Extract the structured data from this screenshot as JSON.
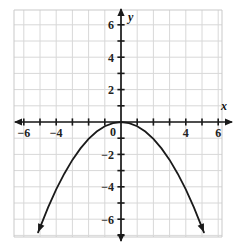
{
  "chart_data": {
    "type": "line",
    "title": "",
    "subtitle": "",
    "xlabel": "x",
    "ylabel": "y",
    "xlim": [
      -7,
      7
    ],
    "ylim": [
      -7,
      7
    ],
    "grid": true,
    "grid_step": 1,
    "legend": "none",
    "equation": "y = -0.26x^2",
    "vertex": [
      0,
      0
    ],
    "opens": "down",
    "x_ticks": [
      -7,
      -6,
      -5,
      -4,
      -3,
      -2,
      -1,
      0,
      1,
      2,
      3,
      4,
      5,
      6,
      7
    ],
    "y_ticks": [
      -7,
      -6,
      -5,
      -4,
      -3,
      -2,
      -1,
      0,
      1,
      2,
      3,
      4,
      5,
      6,
      7
    ],
    "x_tick_labels": [
      {
        "value": -6,
        "text": "−6"
      },
      {
        "value": -4,
        "text": "−4"
      },
      {
        "value": 4,
        "text": "4"
      },
      {
        "value": 6,
        "text": "6"
      }
    ],
    "y_tick_labels": [
      {
        "value": 6,
        "text": "6"
      },
      {
        "value": 4,
        "text": "4"
      },
      {
        "value": 2,
        "text": "2"
      },
      {
        "value": -2,
        "text": "−2"
      },
      {
        "value": -4,
        "text": "−4"
      },
      {
        "value": -6,
        "text": "−6"
      }
    ],
    "origin_label": "0",
    "series": [
      {
        "name": "parabola",
        "x": [
          -5.12,
          -4.5,
          -4.0,
          -3.5,
          -3.0,
          -2.5,
          -2.0,
          -1.5,
          -1.0,
          -0.5,
          0.0,
          0.5,
          1.0,
          1.5,
          2.0,
          2.5,
          3.0,
          3.5,
          4.0,
          4.5,
          5.12
        ],
        "y": [
          -6.81,
          -5.27,
          -4.16,
          -3.19,
          -2.34,
          -1.63,
          -1.04,
          -0.59,
          -0.26,
          -0.07,
          0.0,
          -0.07,
          -0.26,
          -0.59,
          -1.04,
          -1.63,
          -2.34,
          -3.19,
          -4.16,
          -5.27,
          -6.81
        ]
      }
    ]
  },
  "colors": {
    "grid": "#d8d8d8",
    "grid_major": "#c9c9c9",
    "axis": "#1a1a1a",
    "curve": "#1a1a1a",
    "background": "#ffffff",
    "label": "#222222"
  },
  "axes": {
    "x_axis_name": "x",
    "y_axis_name": "y"
  }
}
